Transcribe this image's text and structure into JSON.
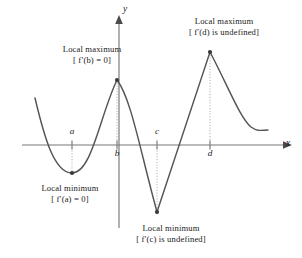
{
  "figure": {
    "background_color": "#ffffff",
    "curve_color": "#555555",
    "axis_color": "#777777",
    "marker_color": "#3a3a3a",
    "leader_color": "#aaaaaa",
    "text_color": "#1a1a1a"
  },
  "axes": {
    "x_label": "x",
    "y_label": "y",
    "x_axis_y": 145,
    "y_axis_x": 119
  },
  "ticks": [
    {
      "label": "a",
      "x": 72,
      "position": "above"
    },
    {
      "label": "b",
      "x": 117,
      "position": "below"
    },
    {
      "label": "c",
      "x": 157,
      "position": "above"
    },
    {
      "label": "d",
      "x": 210,
      "position": "below"
    }
  ],
  "annotations": [
    {
      "id": "max-b",
      "line1": "Local maximum",
      "line2": "[ f′(b) = 0]",
      "kind": "local-maximum",
      "point_x": 117,
      "point_y": 80
    },
    {
      "id": "max-d",
      "line1": "Local maximum",
      "line2": "[ f′(d) is undefined]",
      "kind": "local-maximum",
      "point_x": 210,
      "point_y": 52
    },
    {
      "id": "min-a",
      "line1": "Local minimum",
      "line2": "[ f′(a) = 0]",
      "kind": "local-minimum",
      "point_x": 72,
      "point_y": 173
    },
    {
      "id": "min-c",
      "line1": "Local minimum",
      "line2": "[ f′(c) is undefined]",
      "kind": "local-minimum",
      "point_x": 157,
      "point_y": 212
    }
  ],
  "chart_data": {
    "type": "line",
    "title": "",
    "xlabel": "x",
    "ylabel": "y",
    "grid": false,
    "legend": "none",
    "xlim": [
      20,
      302
    ],
    "ylim": [
      258,
      0
    ],
    "curve_path": "M 35 98 C 44 136, 54 173, 72 173 C 92 173, 100 115, 117 80 C 131 98, 140 150, 157 212 L 210 52 C 228 86, 240 118, 251 127 C 258 132, 262 130, 268 130",
    "critical_points": [
      {
        "name": "a",
        "x": 72,
        "y": 173,
        "type": "local minimum",
        "smooth": true,
        "derivative": "0"
      },
      {
        "name": "b",
        "x": 117,
        "y": 80,
        "type": "local maximum",
        "smooth": true,
        "derivative": "0"
      },
      {
        "name": "c",
        "x": 157,
        "y": 212,
        "type": "local minimum",
        "smooth": false,
        "derivative": "undefined"
      },
      {
        "name": "d",
        "x": 210,
        "y": 52,
        "type": "local maximum",
        "smooth": false,
        "derivative": "undefined"
      }
    ],
    "curve_start": {
      "x": 35,
      "y": 98
    },
    "curve_end": {
      "x": 268,
      "y": 130
    }
  }
}
